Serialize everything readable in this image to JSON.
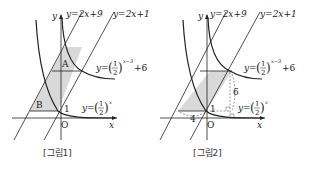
{
  "figures": [
    {
      "caption": "[그림1]",
      "axis_x": "x",
      "axis_y": "y",
      "origin": "O",
      "lines": [
        "y=2x+9",
        "y=2x+1"
      ],
      "curve_upper": {
        "prefix": "y=",
        "base_num": "1",
        "base_den": "2",
        "exponent": "x−3",
        "suffix": "+6"
      },
      "curve_lower": {
        "prefix": "y=",
        "base_num": "1",
        "base_den": "2",
        "exponent": "x"
      },
      "region_labels": [
        "A",
        "B"
      ],
      "y_intercept_label": "1"
    },
    {
      "caption": "[그림2]",
      "axis_x": "x",
      "axis_y": "y",
      "origin": "O",
      "lines": [
        "y=2x+9",
        "y=2x+1"
      ],
      "curve_upper": {
        "prefix": "y=",
        "base_num": "1",
        "base_den": "2",
        "exponent": "x−3",
        "suffix": "+6"
      },
      "curve_lower": {
        "prefix": "y=",
        "base_num": "1",
        "base_den": "2",
        "exponent": "x"
      },
      "y_intercept_label": "1",
      "width_label": "4",
      "height_label": "6"
    }
  ],
  "colors": {
    "shade": "#d9d9d9",
    "ink": "#222222",
    "dashed": "#555555"
  }
}
